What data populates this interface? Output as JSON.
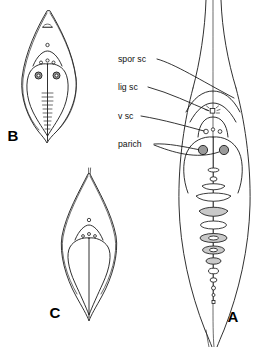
{
  "plate": {
    "background_color": "#ffffff",
    "ink_color": "#1a1a1a",
    "parichnos_fill": "#9a9a9a",
    "disc_fill": "#c9c9c9"
  },
  "annotations": [
    {
      "id": "spor-sc",
      "label": "spor sc",
      "x": 118,
      "y": 62
    },
    {
      "id": "lig-sc",
      "label": "lig sc",
      "x": 118,
      "y": 90
    },
    {
      "id": "v-sc",
      "label": "v sc",
      "x": 118,
      "y": 119
    },
    {
      "id": "parich",
      "label": "parich",
      "x": 118,
      "y": 147
    }
  ],
  "figures": [
    {
      "id": "figure-a",
      "letter": "A",
      "x": 233,
      "y": 322
    },
    {
      "id": "figure-b",
      "letter": "B",
      "x": 13,
      "y": 141
    },
    {
      "id": "figure-c",
      "letter": "C",
      "x": 55,
      "y": 318
    }
  ]
}
